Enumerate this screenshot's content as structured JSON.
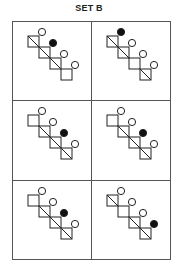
{
  "title": "SET B",
  "colors": {
    "stroke": "#222222",
    "filled_circle": "#111111",
    "open_circle_fill": "#ffffff",
    "grid_line": "#555555"
  },
  "figure_geometry": {
    "square_size": 11,
    "step": 11,
    "circle_radius": 3.6,
    "circle_offset": [
      3,
      -4
    ],
    "start": [
      15,
      14
    ]
  },
  "cells": [
    {
      "label": "row1-col1",
      "squares": [
        {
          "diagonal": true,
          "circle": "open"
        },
        {
          "diagonal": true,
          "circle": "filled"
        },
        {
          "diagonal": true,
          "circle": "open"
        },
        {
          "diagonal": false,
          "circle": "open"
        }
      ]
    },
    {
      "label": "row1-col2",
      "squares": [
        {
          "diagonal": true,
          "circle": "filled"
        },
        {
          "diagonal": true,
          "circle": "open"
        },
        {
          "diagonal": false,
          "circle": "open"
        },
        {
          "diagonal": true,
          "circle": "open"
        }
      ]
    },
    {
      "label": "row2-col1",
      "squares": [
        {
          "diagonal": false,
          "circle": "open"
        },
        {
          "diagonal": true,
          "circle": "open"
        },
        {
          "diagonal": true,
          "circle": "filled"
        },
        {
          "diagonal": true,
          "circle": "open"
        }
      ]
    },
    {
      "label": "row2-col2",
      "squares": [
        {
          "diagonal": false,
          "circle": "open"
        },
        {
          "diagonal": true,
          "circle": "open"
        },
        {
          "diagonal": true,
          "circle": "filled"
        },
        {
          "diagonal": true,
          "circle": "open"
        }
      ]
    },
    {
      "label": "row3-col1",
      "squares": [
        {
          "diagonal": false,
          "circle": "open"
        },
        {
          "diagonal": true,
          "circle": "open"
        },
        {
          "diagonal": true,
          "circle": "filled"
        },
        {
          "diagonal": true,
          "circle": "open"
        }
      ]
    },
    {
      "label": "row3-col2",
      "squares": [
        {
          "diagonal": true,
          "circle": "open"
        },
        {
          "diagonal": false,
          "circle": "open"
        },
        {
          "diagonal": true,
          "circle": "open"
        },
        {
          "diagonal": true,
          "circle": "filled"
        }
      ]
    }
  ]
}
